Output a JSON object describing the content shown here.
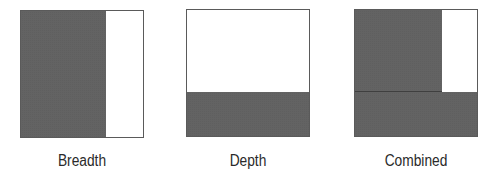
{
  "diagram": {
    "type": "area-coverage-comparison",
    "colors": {
      "filled": "#5b5b5b",
      "empty": "#ffffff",
      "border": "#5a5a5a"
    },
    "panels": [
      {
        "id": "breadth",
        "label": "Breadth",
        "description": "Left portion filled across full height (~70% width)"
      },
      {
        "id": "depth",
        "label": "Depth",
        "description": "Bottom portion filled across full width (~35% height)"
      },
      {
        "id": "combined",
        "label": "Combined",
        "description": "Breadth and depth fills overlaid; only top-right corner remains empty"
      }
    ]
  }
}
